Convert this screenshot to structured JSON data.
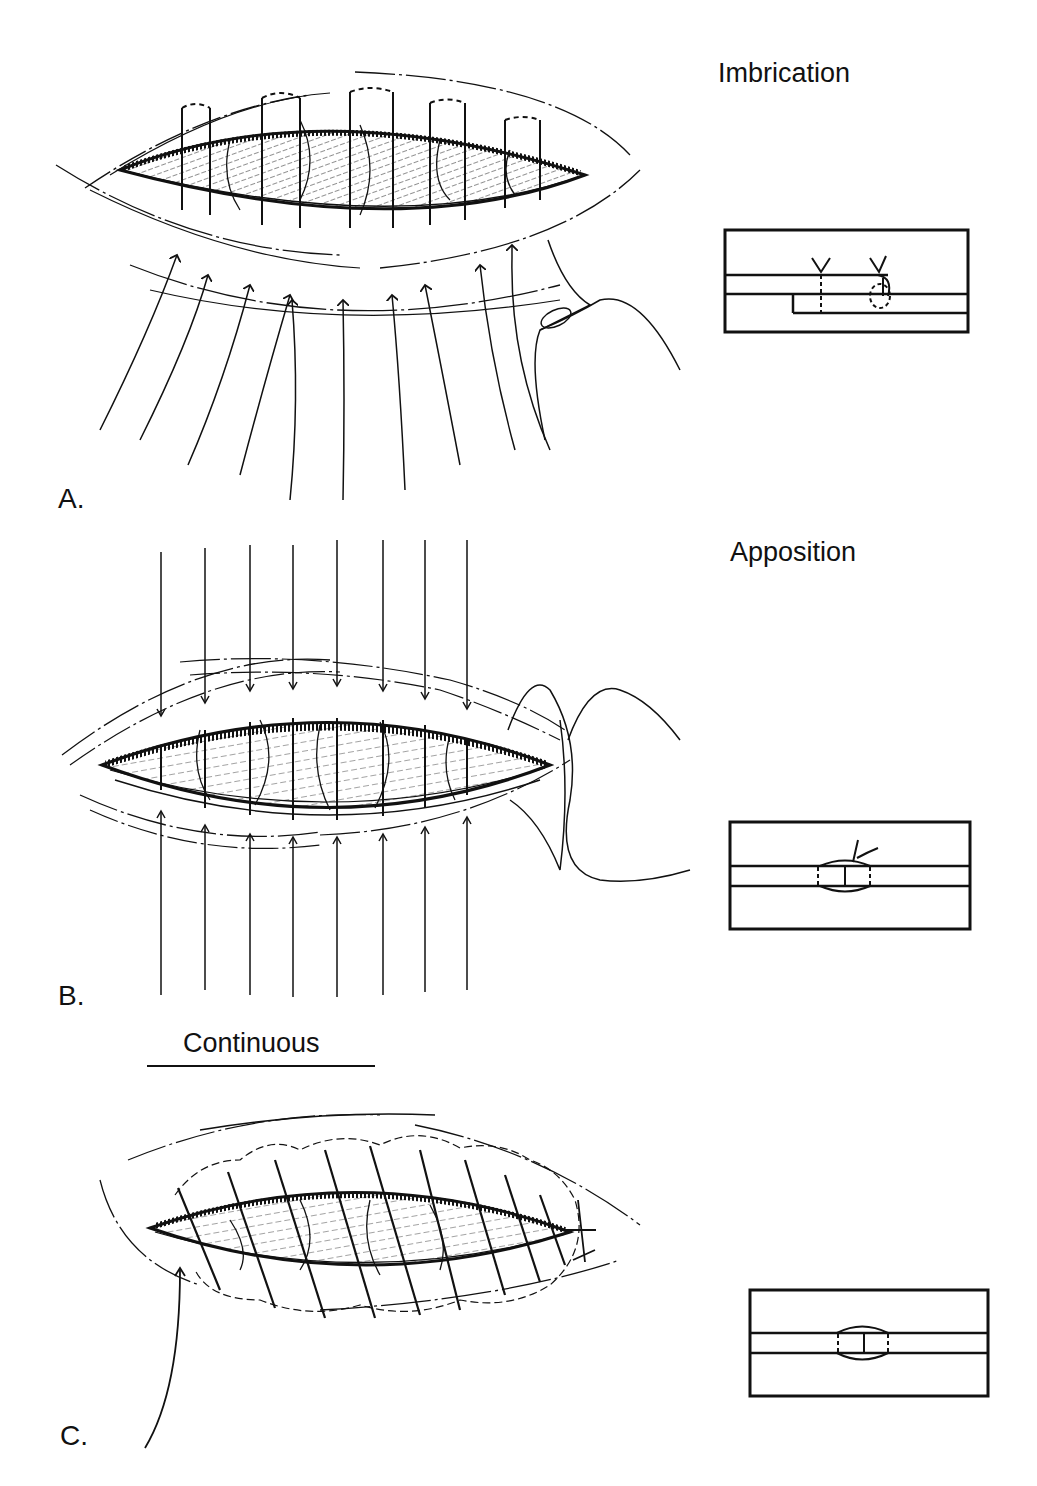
{
  "figure": {
    "panels": [
      {
        "letter": "A.",
        "technique": "Imbrication",
        "suture_count": 9,
        "inset": "overlapping-layers-cross-section"
      },
      {
        "letter": "B.",
        "technique": "Apposition",
        "suture_count": 8,
        "inset": "edge-to-edge-cross-section"
      },
      {
        "letter": "C.",
        "technique": "Continuous",
        "suture_count": 9,
        "inset": "edge-to-edge-cross-section"
      }
    ]
  },
  "colors": {
    "ink": "#111111",
    "paper": "#ffffff"
  }
}
